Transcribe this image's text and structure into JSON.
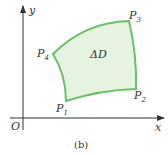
{
  "diagram": {
    "axes": {
      "x_label": "x",
      "y_label": "y",
      "origin_label": "O"
    },
    "region": {
      "label": "ΔD",
      "fill": "#e6f3e1",
      "stroke": "#6cc06a"
    },
    "points": [
      {
        "name": "P",
        "sub": "1"
      },
      {
        "name": "P",
        "sub": "2"
      },
      {
        "name": "P",
        "sub": "3"
      },
      {
        "name": "P",
        "sub": "4"
      }
    ],
    "caption": "(b)"
  }
}
